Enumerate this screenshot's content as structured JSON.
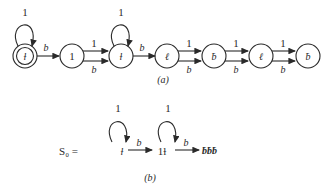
{
  "diagram_a": {
    "caption": "(a)",
    "states": [
      {
        "id": "s0",
        "label": "ƚ",
        "accepting": true,
        "self_loop": "1"
      },
      {
        "id": "s1",
        "label": "1",
        "accepting": false
      },
      {
        "id": "s2",
        "label": "ƚ",
        "accepting": false,
        "self_loop": "1"
      },
      {
        "id": "s3",
        "label": "ℓ",
        "accepting": false
      },
      {
        "id": "s4",
        "label": "ƀ",
        "accepting": false
      },
      {
        "id": "s5",
        "label": "ℓ",
        "accepting": false
      },
      {
        "id": "s6",
        "label": "ƀ",
        "accepting": false
      }
    ],
    "edges": [
      {
        "from": "s0",
        "to": "s1",
        "label": "b"
      },
      {
        "from": "s1",
        "to": "s2",
        "label_top": "1",
        "label_bottom": "b"
      },
      {
        "from": "s2",
        "to": "s3",
        "label": "b"
      },
      {
        "from": "s3",
        "to": "s4",
        "label_top": "1",
        "label_bottom": "b"
      },
      {
        "from": "s4",
        "to": "s5",
        "label_top": "1",
        "label_bottom": "b"
      },
      {
        "from": "s5",
        "to": "s6",
        "label_top": "1",
        "label_bottom": "b"
      }
    ]
  },
  "diagram_b": {
    "caption": "(b)",
    "prefix": "S₀ =",
    "node1_label": "ƚ",
    "node2_label": "1ƚ",
    "tail_label": "ƀƀƀ",
    "loop1_label": "1",
    "loop2_label": "1",
    "edge1_label": "b",
    "edge2_label": "b"
  }
}
